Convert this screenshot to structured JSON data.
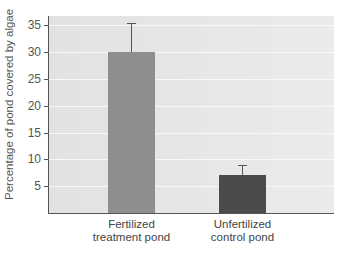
{
  "chart_data": {
    "type": "bar",
    "title": "",
    "xlabel": "",
    "ylabel": "Percentage of pond covered by algae",
    "categories": [
      "Fertilized treatment pond",
      "Unfertilized control pond"
    ],
    "category_lines": [
      [
        "Fertilized",
        "treatment pond"
      ],
      [
        "Unfertilized",
        "control pond"
      ]
    ],
    "values": [
      30,
      7
    ],
    "error_upper": [
      35.5,
      9
    ],
    "colors": [
      "#8e8e8e",
      "#4b4b4b"
    ],
    "ylim": [
      0,
      36
    ],
    "yticks": [
      5,
      10,
      15,
      20,
      25,
      30,
      35
    ],
    "grid": true,
    "legend": null
  }
}
